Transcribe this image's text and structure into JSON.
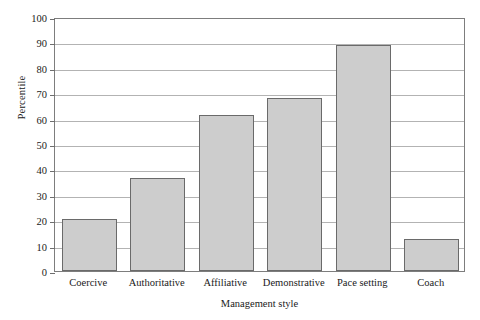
{
  "chart_data": {
    "type": "bar",
    "title": "",
    "xlabel": "Management style",
    "ylabel": "Percentile",
    "categories": [
      "Coercive",
      "Authoritative",
      "Affiliative",
      "Demonstrative",
      "Pace setting",
      "Coach"
    ],
    "values": [
      20.5,
      36.8,
      61.5,
      68.3,
      89,
      12.5
    ],
    "ylim": [
      0,
      100
    ],
    "yticks": [
      0,
      10,
      20,
      30,
      40,
      50,
      60,
      70,
      80,
      90,
      100
    ],
    "ytick_labels": [
      "0",
      "10",
      "20",
      "30",
      "40",
      "50",
      "60",
      "70",
      "80",
      "90",
      "100"
    ],
    "grid": "horizontal",
    "legend": "none",
    "bar_fill_color": "#cdcdcd",
    "bar_edge_color": "#6a6a6a",
    "gridline_color": "#b3b3b3",
    "frame_color": "#7d7d7d"
  }
}
